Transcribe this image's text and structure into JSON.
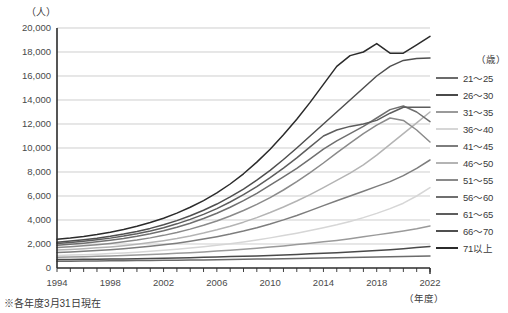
{
  "axis_unit_y": "（人）",
  "axis_unit_x": "（年度）",
  "footnote": "※各年度3月31日現在",
  "legend": {
    "unit": "（歳）",
    "items": [
      {
        "label": "21～25",
        "color": "#6b6b6b"
      },
      {
        "label": "26～30",
        "color": "#4a4a4a"
      },
      {
        "label": "31～35",
        "color": "#9a9a9a"
      },
      {
        "label": "36～40",
        "color": "#d6d6d6"
      },
      {
        "label": "41～45",
        "color": "#7d7d7d"
      },
      {
        "label": "46～50",
        "color": "#b4b4b4"
      },
      {
        "label": "51～55",
        "color": "#8a8a8a"
      },
      {
        "label": "56～60",
        "color": "#6f6f6f"
      },
      {
        "label": "61～65",
        "color": "#5d5d5d"
      },
      {
        "label": "66～70",
        "color": "#4f4f4f"
      },
      {
        "label": "71以上",
        "color": "#2b2b2b"
      }
    ]
  },
  "chart_data": {
    "type": "line",
    "title": "",
    "xlabel": "（年度）",
    "ylabel": "（人）",
    "xlim": [
      1994,
      2022
    ],
    "ylim": [
      0,
      20000
    ],
    "ytick_step": 2000,
    "yticks": [
      0,
      2000,
      4000,
      6000,
      8000,
      10000,
      12000,
      14000,
      16000,
      18000,
      20000
    ],
    "ytick_labels": [
      "0",
      "2,000",
      "4,000",
      "6,000",
      "8,000",
      "10,000",
      "12,000",
      "14,000",
      "16,000",
      "18,000",
      "20,000"
    ],
    "xticks": [
      1994,
      1998,
      2002,
      2006,
      2010,
      2014,
      2018,
      2022
    ],
    "xtick_labels": [
      "1994",
      "1998",
      "2002",
      "2006",
      "2010",
      "2014",
      "2018",
      "2022"
    ],
    "x": [
      1994,
      1995,
      1996,
      1997,
      1998,
      1999,
      2000,
      2001,
      2002,
      2003,
      2004,
      2005,
      2006,
      2007,
      2008,
      2009,
      2010,
      2011,
      2012,
      2013,
      2014,
      2015,
      2016,
      2017,
      2018,
      2019,
      2020,
      2021,
      2022
    ],
    "grid": true,
    "legend_position": "right",
    "series": [
      {
        "name": "21～25",
        "color": "#6b6b6b",
        "values": [
          560,
          570,
          580,
          590,
          600,
          610,
          620,
          630,
          640,
          650,
          660,
          670,
          690,
          700,
          720,
          740,
          760,
          780,
          800,
          820,
          840,
          860,
          880,
          900,
          920,
          940,
          960,
          980,
          1000
        ]
      },
      {
        "name": "26～30",
        "color": "#4a4a4a",
        "values": [
          700,
          710,
          720,
          730,
          740,
          760,
          780,
          800,
          820,
          840,
          860,
          890,
          920,
          950,
          980,
          1010,
          1050,
          1090,
          1130,
          1180,
          1230,
          1280,
          1340,
          1400,
          1460,
          1520,
          1600,
          1700,
          1800
        ]
      },
      {
        "name": "31～35",
        "color": "#9a9a9a",
        "values": [
          900,
          920,
          940,
          970,
          1000,
          1040,
          1080,
          1120,
          1170,
          1220,
          1280,
          1340,
          1410,
          1480,
          1560,
          1650,
          1740,
          1840,
          1950,
          2060,
          2180,
          2300,
          2440,
          2600,
          2760,
          2920,
          3090,
          3280,
          3500
        ]
      },
      {
        "name": "36～40",
        "color": "#d6d6d6",
        "values": [
          1050,
          1080,
          1110,
          1150,
          1200,
          1260,
          1320,
          1390,
          1470,
          1560,
          1660,
          1770,
          1890,
          2020,
          2170,
          2330,
          2510,
          2700,
          2900,
          3120,
          3350,
          3600,
          3880,
          4200,
          4550,
          4950,
          5400,
          6000,
          6700
        ]
      },
      {
        "name": "41～45",
        "color": "#7d7d7d",
        "values": [
          1300,
          1340,
          1390,
          1450,
          1520,
          1600,
          1700,
          1810,
          1930,
          2070,
          2230,
          2410,
          2610,
          2830,
          3080,
          3360,
          3670,
          4010,
          4380,
          4780,
          5200,
          5600,
          6000,
          6400,
          6800,
          7200,
          7700,
          8300,
          9000
        ]
      },
      {
        "name": "46～50",
        "color": "#b4b4b4",
        "values": [
          1500,
          1550,
          1610,
          1680,
          1760,
          1860,
          1980,
          2120,
          2280,
          2460,
          2670,
          2910,
          3180,
          3480,
          3820,
          4200,
          4620,
          5080,
          5580,
          6120,
          6700,
          7300,
          7900,
          8600,
          9400,
          10300,
          11200,
          12100,
          13000
        ]
      },
      {
        "name": "51～55",
        "color": "#8a8a8a",
        "values": [
          1700,
          1770,
          1850,
          1940,
          2050,
          2180,
          2330,
          2510,
          2720,
          2960,
          3240,
          3560,
          3920,
          4330,
          4790,
          5300,
          5870,
          6500,
          7200,
          7950,
          8750,
          9600,
          10400,
          11200,
          11900,
          12500,
          12300,
          11500,
          10500
        ]
      },
      {
        "name": "56～60",
        "color": "#6f6f6f",
        "values": [
          1900,
          1980,
          2070,
          2180,
          2310,
          2460,
          2640,
          2850,
          3100,
          3390,
          3730,
          4120,
          4560,
          5060,
          5610,
          6220,
          6900,
          7600,
          8300,
          9100,
          9900,
          10600,
          11200,
          11800,
          12500,
          13200,
          13500,
          13000,
          12200
        ]
      },
      {
        "name": "61～65",
        "color": "#5d5d5d",
        "values": [
          2050,
          2130,
          2230,
          2350,
          2490,
          2660,
          2860,
          3090,
          3360,
          3680,
          4050,
          4470,
          4950,
          5500,
          6110,
          6790,
          7530,
          8330,
          9180,
          10100,
          11000,
          11500,
          11800,
          12000,
          12300,
          12900,
          13400,
          13400,
          13400
        ]
      },
      {
        "name": "66～70",
        "color": "#4f4f4f",
        "values": [
          2150,
          2240,
          2350,
          2480,
          2640,
          2830,
          3050,
          3300,
          3600,
          3950,
          4350,
          4810,
          5330,
          5920,
          6580,
          7320,
          8140,
          9040,
          10000,
          11000,
          12000,
          13000,
          14000,
          15000,
          16000,
          16800,
          17300,
          17450,
          17500
        ]
      },
      {
        "name": "71以上",
        "color": "#2b2b2b",
        "values": [
          2400,
          2500,
          2630,
          2790,
          2980,
          3210,
          3480,
          3790,
          4150,
          4570,
          5060,
          5620,
          6260,
          7000,
          7850,
          8820,
          9900,
          11100,
          12400,
          13800,
          15300,
          16800,
          17700,
          18000,
          18700,
          17900,
          17900,
          18600,
          19300
        ]
      }
    ]
  }
}
